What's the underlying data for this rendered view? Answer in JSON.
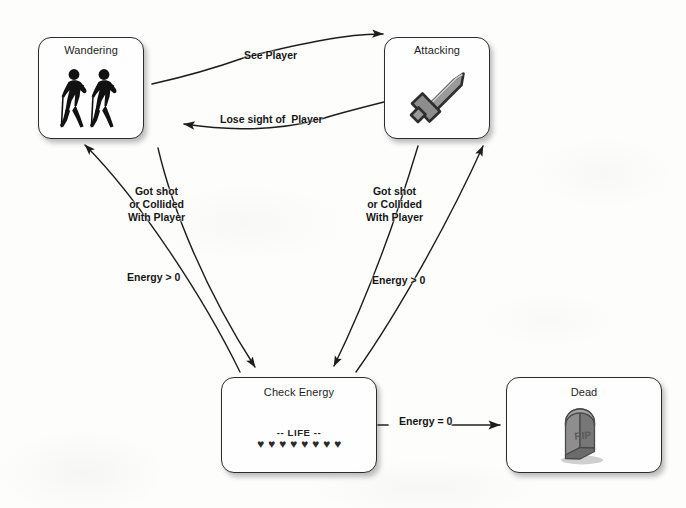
{
  "diagram": {
    "type": "state-machine",
    "background_color": "#fdfdfc",
    "line_color": "#1f1f1f",
    "box_border_color": "#2c2c2c",
    "box_fill_color": "#fefefe"
  },
  "states": [
    {
      "id": "wandering",
      "label": "Wandering",
      "icon": "two-walking-hikers-icon",
      "x": 38,
      "y": 37,
      "w": 106,
      "h": 102
    },
    {
      "id": "attacking",
      "label": "Attacking",
      "icon": "sword-icon",
      "x": 384,
      "y": 37,
      "w": 106,
      "h": 102
    },
    {
      "id": "check_energy",
      "label": "Check Energy",
      "icon": "life-meter-icon",
      "x": 221,
      "y": 377,
      "w": 156,
      "h": 96,
      "life": {
        "caption": "-- LIFE --",
        "heart_glyph": "♥",
        "hearts_total": 8,
        "hearts_filled": 8
      }
    },
    {
      "id": "dead",
      "label": "Dead",
      "icon": "gravestone-rip-icon",
      "x": 506,
      "y": 377,
      "w": 156,
      "h": 96
    }
  ],
  "transitions": [
    {
      "id": "see_player",
      "label": "See Player",
      "from": "wandering",
      "to": "attacking",
      "label_x": 244,
      "label_y": 49
    },
    {
      "id": "lose_sight",
      "label": "Lose sight of  Player",
      "from": "attacking",
      "to": "wandering",
      "label_x": 220,
      "label_y": 113
    },
    {
      "id": "wander_damaged",
      "label": "Got shot\nor Collided\nWith Player",
      "from": "wandering",
      "to": "check_energy",
      "label_x": 128,
      "label_y": 185
    },
    {
      "id": "attack_damaged",
      "label": "Got shot\nor Collided\nWith Player",
      "from": "attacking",
      "to": "check_energy",
      "label_x": 366,
      "label_y": 185
    },
    {
      "id": "energy_left_wander",
      "label": "Energy > 0",
      "from": "check_energy",
      "to": "wandering",
      "label_x": 127,
      "label_y": 271
    },
    {
      "id": "energy_left_attack",
      "label": "Energy > 0",
      "from": "check_energy",
      "to": "attacking",
      "label_x": 372,
      "label_y": 274
    },
    {
      "id": "energy_zero",
      "label": "Energy = 0",
      "from": "check_energy",
      "to": "dead",
      "label_x": 399,
      "label_y": 415
    }
  ]
}
